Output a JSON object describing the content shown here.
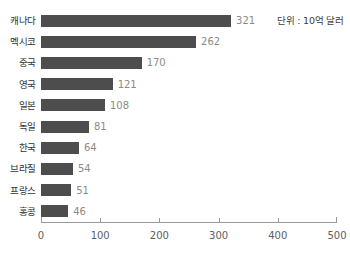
{
  "chart": {
    "annotation": "단위 : 10억 달러"
  },
  "chart_data": {
    "type": "bar",
    "orientation": "horizontal",
    "title": "",
    "subtitle": "",
    "xlabel": "",
    "ylabel": "",
    "annotations": [
      "단위 : 10억 달러"
    ],
    "legend": [],
    "grid": false,
    "xlim": [
      0,
      500
    ],
    "xticks": [
      0,
      100,
      200,
      300,
      400,
      500
    ],
    "xtick_labels": [
      "0",
      "100",
      "200",
      "300",
      "400",
      "500"
    ],
    "bar_color": "#4d4d4d",
    "value_label_color": "#8a8a8a",
    "categories": [
      "캐나다",
      "멕시코",
      "중국",
      "영국",
      "일본",
      "독일",
      "한국",
      "브라질",
      "프랑스",
      "홍콩"
    ],
    "values": [
      321,
      262,
      170,
      121,
      108,
      81,
      64,
      54,
      51,
      46
    ],
    "value_labels": [
      "321",
      "262",
      "170",
      "121",
      "108",
      "81",
      "64",
      "54",
      "51",
      "46"
    ]
  }
}
